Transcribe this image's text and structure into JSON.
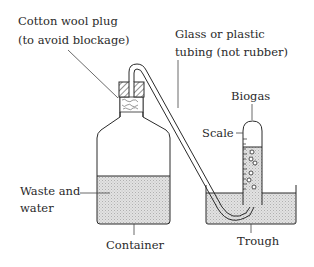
{
  "diagram": {
    "labels": {
      "cotton_wool_line1": "Cotton wool plug",
      "cotton_wool_line2": "(to avoid blockage)",
      "tubing_line1": "Glass or plastic",
      "tubing_line2": "tubing (not rubber)",
      "biogas": "Biogas",
      "scale": "Scale",
      "waste_line1": "Waste and",
      "waste_line2": "water",
      "container": "Container",
      "trough": "Trough"
    },
    "colors": {
      "line": "#2a2a2a",
      "liquid_fill": "#d9d9d9",
      "background": "#ffffff"
    }
  }
}
